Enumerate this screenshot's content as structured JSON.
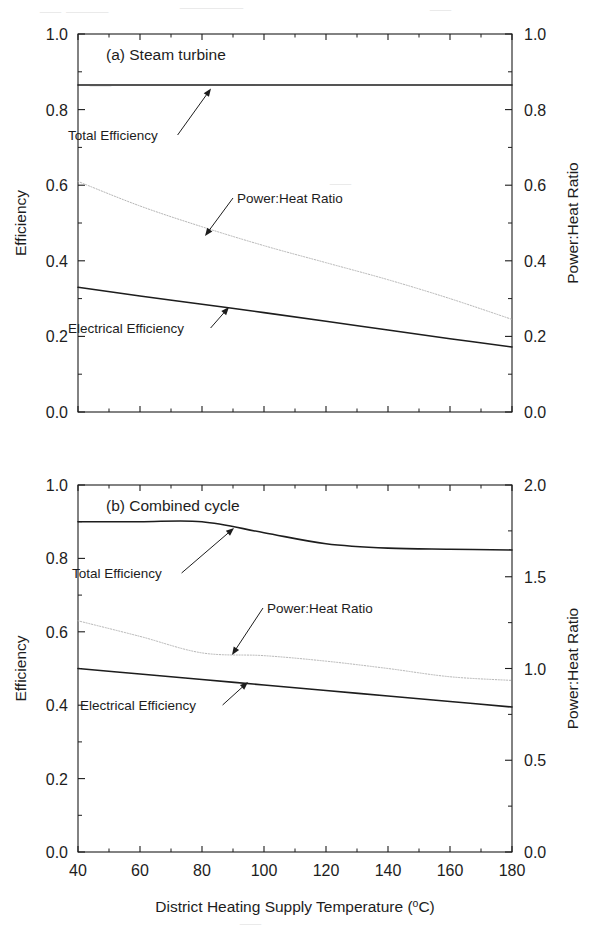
{
  "figure": {
    "width": 602,
    "height": 949,
    "background": "#ffffff",
    "ink_color": "#1d1d1d",
    "faint_artifact_color": "#d9d9d9"
  },
  "x_axis": {
    "title": "District Heating Supply Temperature (",
    "title_sup": "o",
    "title_tail": "C)",
    "title_full": "District Heating Supply Temperature (°C)",
    "min": 40,
    "max": 180,
    "tick_step": 20,
    "minor_ticks": true,
    "ticks": [
      "40",
      "60",
      "80",
      "100",
      "120",
      "140",
      "160",
      "180"
    ],
    "tick_values": [
      40,
      60,
      80,
      100,
      120,
      140,
      160,
      180
    ]
  },
  "panels": [
    {
      "id": "panel-a",
      "title": "(a) Steam turbine",
      "left_axis": {
        "title": "Efficiency",
        "min": 0.0,
        "max": 1.0,
        "tick_step": 0.2,
        "ticks": [
          "0.0",
          "0.2",
          "0.4",
          "0.6",
          "0.8",
          "1.0"
        ],
        "tick_values": [
          0.0,
          0.2,
          0.4,
          0.6,
          0.8,
          1.0
        ]
      },
      "right_axis": {
        "title": "Power:Heat Ratio",
        "min": 0.0,
        "max": 1.0,
        "tick_step": 0.2,
        "ticks": [
          "0.0",
          "0.2",
          "0.4",
          "0.6",
          "0.8",
          "1.0"
        ],
        "tick_values": [
          0.0,
          0.2,
          0.4,
          0.6,
          0.8,
          1.0
        ]
      },
      "annotations": [
        {
          "id": "a-total",
          "label": "Total Efficiency",
          "text_x": 68,
          "text_y": 140,
          "tip_x": 211,
          "tip_y": 88.5
        },
        {
          "id": "a-phr",
          "label": "Power:Heat Ratio",
          "text_x": 237,
          "text_y": 203,
          "tip_x": 205,
          "tip_y": 236
        },
        {
          "id": "a-electrical",
          "label": "Electrical Efficiency",
          "text_x": 68,
          "text_y": 333,
          "tip_x": 229,
          "tip_y": 307
        }
      ]
    },
    {
      "id": "panel-b",
      "title": "(b) Combined cycle",
      "left_axis": {
        "title": "Efficiency",
        "min": 0.0,
        "max": 1.0,
        "tick_step": 0.2,
        "ticks": [
          "0.0",
          "0.2",
          "0.4",
          "0.6",
          "0.8",
          "1.0"
        ],
        "tick_values": [
          0.0,
          0.2,
          0.4,
          0.6,
          0.8,
          1.0
        ]
      },
      "right_axis": {
        "title": "Power:Heat Ratio",
        "min": 0.0,
        "max": 2.0,
        "tick_step": 0.5,
        "ticks": [
          "0.0",
          "0.5",
          "1.0",
          "1.5",
          "2.0"
        ],
        "tick_values": [
          0.0,
          0.5,
          1.0,
          1.5,
          2.0
        ]
      },
      "annotations": [
        {
          "id": "b-total",
          "label": "Total Efficiency",
          "text_x": 72,
          "text_y": 578,
          "tip_x": 234,
          "tip_y": 528
        },
        {
          "id": "b-phr",
          "label": "Power:Heat Ratio",
          "text_x": 267,
          "text_y": 613,
          "tip_x": 232,
          "tip_y": 655
        },
        {
          "id": "b-electrical",
          "label": "Electrical Efficiency",
          "text_x": 80,
          "text_y": 710,
          "tip_x": 248,
          "tip_y": 682
        }
      ]
    }
  ],
  "chart_data": [
    {
      "type": "line",
      "panel": "a",
      "title": "(a) Steam turbine",
      "xlabel": "District Heating Supply Temperature (°C)",
      "ylabel": "Efficiency",
      "y2label": "Power:Heat Ratio",
      "xlim": [
        40,
        180
      ],
      "ylim": [
        0.0,
        1.0
      ],
      "y2lim": [
        0.0,
        1.0
      ],
      "grid": false,
      "legend": "annotated-inline",
      "x": [
        40,
        60,
        80,
        100,
        120,
        140,
        160,
        180
      ],
      "series": [
        {
          "name": "Total Efficiency",
          "axis": "left",
          "style": "solid",
          "color": "#1d1d1d",
          "width": 1.6,
          "values": [
            0.865,
            0.865,
            0.865,
            0.865,
            0.865,
            0.865,
            0.865,
            0.865
          ]
        },
        {
          "name": "Power:Heat Ratio",
          "axis": "right",
          "style": "dotted-light",
          "color": "#b5b5b5",
          "width": 1.0,
          "values": [
            0.61,
            0.545,
            0.49,
            0.44,
            0.395,
            0.35,
            0.3,
            0.245
          ]
        },
        {
          "name": "Electrical Efficiency",
          "axis": "left",
          "style": "solid",
          "color": "#1d1d1d",
          "width": 1.6,
          "values": [
            0.33,
            0.307,
            0.285,
            0.263,
            0.24,
            0.217,
            0.194,
            0.172
          ]
        }
      ]
    },
    {
      "type": "line",
      "panel": "b",
      "title": "(b) Combined cycle",
      "xlabel": "District Heating Supply Temperature (°C)",
      "ylabel": "Efficiency",
      "y2label": "Power:Heat Ratio",
      "xlim": [
        40,
        180
      ],
      "ylim": [
        0.0,
        1.0
      ],
      "y2lim": [
        0.0,
        2.0
      ],
      "grid": false,
      "legend": "annotated-inline",
      "x": [
        40,
        60,
        80,
        100,
        120,
        140,
        160,
        180
      ],
      "series": [
        {
          "name": "Total Efficiency",
          "axis": "left",
          "style": "solid",
          "color": "#1d1d1d",
          "width": 1.6,
          "values": [
            0.9,
            0.9,
            0.9,
            0.87,
            0.84,
            0.828,
            0.825,
            0.823
          ]
        },
        {
          "name": "Power:Heat Ratio",
          "axis": "right",
          "style": "dotted-light",
          "color": "#b5b5b5",
          "width": 1.0,
          "values": [
            1.26,
            1.175,
            1.085,
            1.07,
            1.04,
            1.0,
            0.955,
            0.935
          ]
        },
        {
          "name": "Electrical Efficiency",
          "axis": "left",
          "style": "solid",
          "color": "#1d1d1d",
          "width": 1.6,
          "values": [
            0.5,
            0.485,
            0.47,
            0.455,
            0.44,
            0.425,
            0.41,
            0.395
          ]
        }
      ]
    }
  ],
  "artifacts": {
    "note": "faint scanner bleed-through marks",
    "marks": [
      {
        "text": "— ——",
        "x": 40,
        "y": 18
      },
      {
        "text": "———",
        "x": 180,
        "y": 14
      },
      {
        "text": "—",
        "x": 430,
        "y": 16
      },
      {
        "text": "—",
        "x": 90,
        "y": 92
      },
      {
        "text": "—",
        "x": 330,
        "y": 190
      },
      {
        "text": "—",
        "x": 240,
        "y": 930
      }
    ]
  }
}
